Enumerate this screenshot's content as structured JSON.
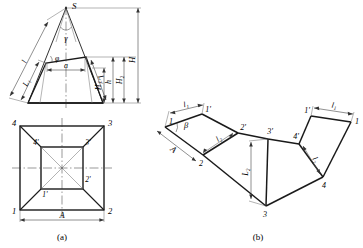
{
  "figure": {
    "caption_a": "(a)",
    "caption_b": "(b)",
    "line_color": "#1a1a1a",
    "thin_color": "#555555",
    "bg_color": "#ffffff"
  },
  "view_a": {
    "name": "elevation-and-plan",
    "elevation": {
      "apex_label": "S",
      "angle_gamma": "γ",
      "angle_phi": "φ",
      "slant_left": "l",
      "slant_left_lower": "L₁",
      "slant_right_lower": "L₂",
      "top_width": "a",
      "height_h": "h",
      "height_H": "H",
      "height_H1": "H₁",
      "height_H2": "H₂"
    },
    "plan": {
      "outer_corners": [
        "1",
        "2",
        "3",
        "4"
      ],
      "inner_corners": [
        "1'",
        "2'",
        "3'",
        "4'"
      ],
      "base_width": "A"
    }
  },
  "view_b": {
    "name": "flat-pattern-development",
    "labels": {
      "top_left_len": "l₁",
      "top_right_len": "l₁",
      "side_A": "A",
      "diag_left": "l₂",
      "diag_right": "l₂",
      "mid_height": "L₂",
      "angle_beta": "β"
    },
    "nodes": [
      "1",
      "1'",
      "2",
      "2'",
      "3",
      "3'",
      "4",
      "4'",
      "1",
      "1'"
    ]
  }
}
